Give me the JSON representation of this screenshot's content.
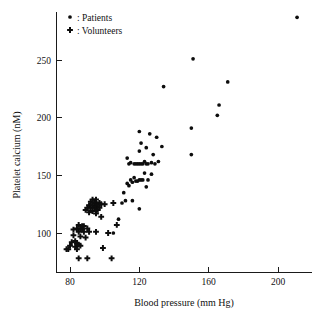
{
  "chart_data": {
    "type": "scatter",
    "title": "",
    "xlabel": "Blood pressure (mm Hg)",
    "ylabel": "Platelet calcium (nM)",
    "xlim": [
      74,
      216
    ],
    "ylim": [
      70,
      290
    ],
    "xticks": [
      80,
      120,
      160,
      200
    ],
    "xticklabels": [
      "80",
      "120",
      "160",
      "200"
    ],
    "yticks": [
      100,
      150,
      200,
      250
    ],
    "yticklabels": [
      "100",
      "150",
      "200",
      "250"
    ],
    "grid": false,
    "legend_position": "top-left",
    "series": [
      {
        "name": "Patients",
        "marker": "circle",
        "legend_label": ": Patients",
        "color": "#0d0d0d",
        "points": [
          [
            105,
            100
          ],
          [
            108,
            112
          ],
          [
            110,
            126
          ],
          [
            111,
            135
          ],
          [
            112,
            128
          ],
          [
            113,
            165
          ],
          [
            113,
            143
          ],
          [
            114,
            141
          ],
          [
            114,
            160
          ],
          [
            115,
            146
          ],
          [
            115,
            161
          ],
          [
            116,
            128
          ],
          [
            116,
            144
          ],
          [
            117,
            148
          ],
          [
            117,
            160
          ],
          [
            118,
            145
          ],
          [
            118,
            160
          ],
          [
            119,
            145
          ],
          [
            119,
            160
          ],
          [
            120,
            121
          ],
          [
            120,
            146
          ],
          [
            120,
            160
          ],
          [
            120,
            171
          ],
          [
            120,
            188
          ],
          [
            121,
            146
          ],
          [
            121,
            160
          ],
          [
            121,
            178
          ],
          [
            122,
            146
          ],
          [
            122,
            160
          ],
          [
            123,
            152
          ],
          [
            123,
            162
          ],
          [
            124,
            140
          ],
          [
            124,
            160
          ],
          [
            124,
            174
          ],
          [
            125,
            146
          ],
          [
            125,
            160
          ],
          [
            126,
            186
          ],
          [
            127,
            151
          ],
          [
            127,
            161
          ],
          [
            128,
            168
          ],
          [
            129,
            160
          ],
          [
            130,
            183
          ],
          [
            131,
            162
          ],
          [
            133,
            175
          ],
          [
            134,
            227
          ],
          [
            150,
            168
          ],
          [
            150,
            191
          ],
          [
            151,
            251
          ],
          [
            165,
            202
          ],
          [
            166,
            211
          ],
          [
            171,
            231
          ],
          [
            211,
            287
          ]
        ]
      },
      {
        "name": "Volunteers",
        "marker": "plus",
        "legend_label": ": Volunteers",
        "color": "#0d0d0d",
        "points": [
          [
            78,
            86
          ],
          [
            79,
            86
          ],
          [
            80,
            89
          ],
          [
            81,
            92
          ],
          [
            82,
            98
          ],
          [
            82,
            103
          ],
          [
            83,
            88
          ],
          [
            83,
            93
          ],
          [
            84,
            86
          ],
          [
            84,
            91
          ],
          [
            84,
            104
          ],
          [
            85,
            78
          ],
          [
            85,
            90
          ],
          [
            85,
            101
          ],
          [
            85,
            107
          ],
          [
            86,
            89
          ],
          [
            86,
            97
          ],
          [
            86,
            104
          ],
          [
            87,
            103
          ],
          [
            87,
            106
          ],
          [
            88,
            101
          ],
          [
            88,
            106
          ],
          [
            89,
            96
          ],
          [
            89,
            120
          ],
          [
            90,
            78
          ],
          [
            90,
            104
          ],
          [
            90,
            122
          ],
          [
            91,
            101
          ],
          [
            91,
            118
          ],
          [
            91,
            124
          ],
          [
            92,
            122
          ],
          [
            92,
            127
          ],
          [
            93,
            119
          ],
          [
            93,
            124
          ],
          [
            93,
            129
          ],
          [
            94,
            122
          ],
          [
            94,
            126
          ],
          [
            95,
            101
          ],
          [
            95,
            117
          ],
          [
            95,
            123
          ],
          [
            95,
            129
          ],
          [
            96,
            120
          ],
          [
            96,
            125
          ],
          [
            97,
            122
          ],
          [
            97,
            126
          ],
          [
            98,
            114
          ],
          [
            98,
            125
          ],
          [
            99,
            87
          ],
          [
            100,
            125
          ],
          [
            102,
            100
          ],
          [
            104,
            78
          ],
          [
            105,
            126
          ],
          [
            107,
            107
          ]
        ]
      }
    ]
  },
  "legend": {
    "entries": [
      {
        "label": ": Patients",
        "marker": "circle"
      },
      {
        "label": ": Volunteers",
        "marker": "plus"
      }
    ]
  },
  "axes": {
    "x_title": "Blood pressure (mm Hg)",
    "y_title": "Platelet calcium (nM)"
  },
  "colors": {
    "marker": "#0d0d0d",
    "axis": "#1a1a1a",
    "background": "#ffffff"
  }
}
